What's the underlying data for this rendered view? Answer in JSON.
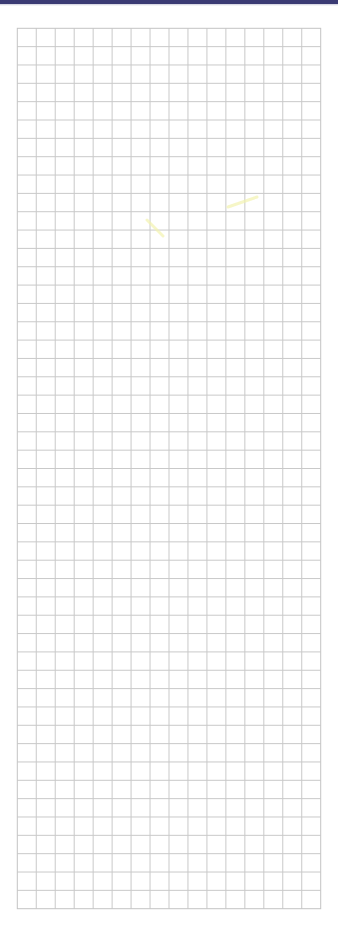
{
  "page": {
    "type": "grid-paper",
    "background_color": "#ffffff",
    "top_band": {
      "color": "#3b3b74",
      "height": 4
    }
  },
  "grid": {
    "columns": 16,
    "rows": 48,
    "left": 17.3,
    "top": 28.3,
    "right": 320.7,
    "bottom": 908.7,
    "line_color": "#c9c9c9",
    "border_color": "#c4c4c4",
    "line_width": 1
  },
  "marks": [
    {
      "name": "highlighter-stroke-1",
      "x1": 147,
      "y1": 220,
      "x2": 163,
      "y2": 236,
      "color": "#f3f3b0"
    },
    {
      "name": "highlighter-stroke-2",
      "x1": 228,
      "y1": 207,
      "x2": 257,
      "y2": 197,
      "color": "#f3f3b0"
    }
  ]
}
